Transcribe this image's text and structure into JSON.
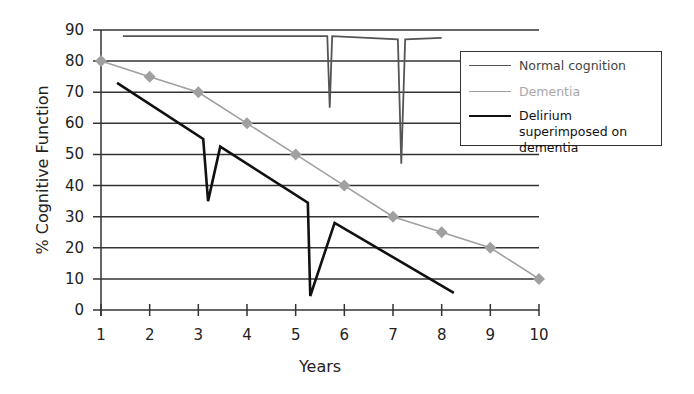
{
  "chart_data": {
    "type": "line",
    "title": "",
    "xlabel": "Years",
    "ylabel": "% Cognitive Function",
    "xlim": [
      1,
      10
    ],
    "ylim": [
      0,
      90
    ],
    "xticks": [
      1,
      2,
      3,
      4,
      5,
      6,
      7,
      8,
      9,
      10
    ],
    "yticks": [
      0,
      10,
      20,
      30,
      40,
      50,
      60,
      70,
      80,
      90
    ],
    "grid": "horizontal",
    "legend_position": "upper right",
    "series": [
      {
        "name": "Normal cognition",
        "color": "#555555",
        "marker": "none",
        "points": [
          [
            1.45,
            88
          ],
          [
            5.65,
            88
          ],
          [
            5.7,
            65
          ],
          [
            5.75,
            88
          ],
          [
            7.1,
            87
          ],
          [
            7.17,
            47
          ],
          [
            7.25,
            87
          ],
          [
            8.0,
            87.5
          ]
        ]
      },
      {
        "name": "Dementia",
        "color": "#a0a0a0",
        "marker": "diamond",
        "points": [
          [
            1,
            80
          ],
          [
            2,
            75
          ],
          [
            3,
            70
          ],
          [
            4,
            60
          ],
          [
            5,
            50
          ],
          [
            6,
            40
          ],
          [
            7,
            30
          ],
          [
            8,
            25
          ],
          [
            9,
            20
          ],
          [
            10,
            10
          ]
        ]
      },
      {
        "name": "Delirium superimposed on dementia",
        "color": "#111111",
        "marker": "none",
        "points": [
          [
            1.33,
            73
          ],
          [
            3.1,
            55
          ],
          [
            3.2,
            35
          ],
          [
            3.45,
            52.5
          ],
          [
            5.25,
            34.5
          ],
          [
            5.3,
            4.5
          ],
          [
            5.8,
            28
          ],
          [
            8.25,
            5.5
          ]
        ]
      }
    ]
  },
  "legend": {
    "items": [
      {
        "label": "Normal cognition",
        "color": "#555555",
        "text_color": "#444444"
      },
      {
        "label": "Dementia",
        "color": "#a0a0a0",
        "text_color": "#a8a8a8"
      },
      {
        "label": "Delirium superimposed on dementia",
        "color": "#111111",
        "text_color": "#111111"
      }
    ]
  },
  "axes": {
    "xlabel": "Years",
    "ylabel": "% Cognitive Function"
  }
}
